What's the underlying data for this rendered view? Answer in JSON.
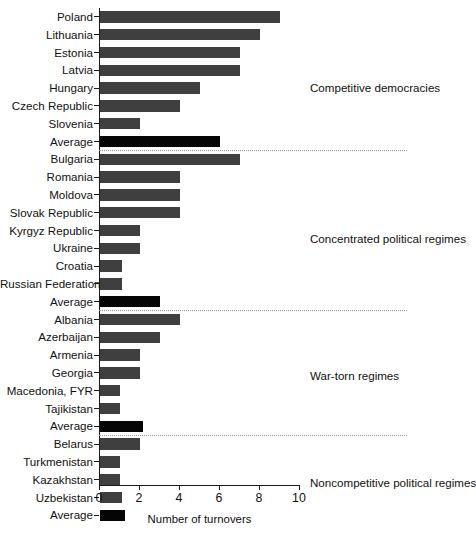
{
  "chart_data": {
    "type": "bar",
    "orientation": "horizontal",
    "title": "",
    "xlabel": "Number of turnovers",
    "ylabel": "",
    "xlim": [
      0,
      10
    ],
    "xticks": [
      0,
      2,
      4,
      6,
      8,
      10
    ],
    "grid": false,
    "legend": null,
    "categories": [
      "Poland",
      "Lithuania",
      "Estonia",
      "Latvia",
      "Hungary",
      "Czech Republic",
      "Slovenia",
      "Average",
      "Bulgaria",
      "Romania",
      "Moldova",
      "Slovak Republic",
      "Kyrgyz Republic",
      "Ukraine",
      "Croatia",
      "Russian Federation",
      "Average",
      "Albania",
      "Azerbaijan",
      "Armenia",
      "Georgia",
      "Macedonia, FYR",
      "Tajikistan",
      "Average",
      "Belarus",
      "Turkmenistan",
      "Kazakhstan",
      "Uzbekistan",
      "Average"
    ],
    "values": [
      9,
      8,
      7,
      7,
      5,
      4,
      2,
      6,
      7,
      4,
      4,
      4,
      2,
      2,
      1.1,
      1.1,
      3,
      4,
      3,
      2,
      2,
      1,
      1,
      2.15,
      2,
      1,
      1,
      1.1,
      1.25
    ],
    "bar_kinds": [
      "country",
      "country",
      "country",
      "country",
      "country",
      "country",
      "country",
      "average",
      "country",
      "country",
      "country",
      "country",
      "country",
      "country",
      "country",
      "country",
      "average",
      "country",
      "country",
      "country",
      "country",
      "country",
      "country",
      "average",
      "country",
      "country",
      "country",
      "country",
      "average"
    ],
    "colors": {
      "country_bar": "#3f3f3f",
      "average_bar": "#050505",
      "axis": "#1a1a1a",
      "separator": "#9a9a9a",
      "background": "#ffffff",
      "text": "#111111"
    },
    "group_annotations": [
      {
        "label": "Competitive democracies",
        "after_index": 7
      },
      {
        "label": "Concentrated political regimes",
        "after_index": 16
      },
      {
        "label": "War-torn regimes",
        "after_index": 23
      },
      {
        "label": "Noncompetitive political regimes",
        "after_index": 28
      }
    ],
    "separators_after_index": [
      7,
      16,
      23
    ]
  },
  "axis": {
    "x_title": "Number of turnovers",
    "tick_labels": [
      "0",
      "2",
      "4",
      "6",
      "8",
      "10"
    ]
  },
  "groups": [
    {
      "label": "Competitive democracies"
    },
    {
      "label": "Concentrated political regimes"
    },
    {
      "label": "War-torn regimes"
    },
    {
      "label": "Noncompetitive political regimes"
    }
  ]
}
